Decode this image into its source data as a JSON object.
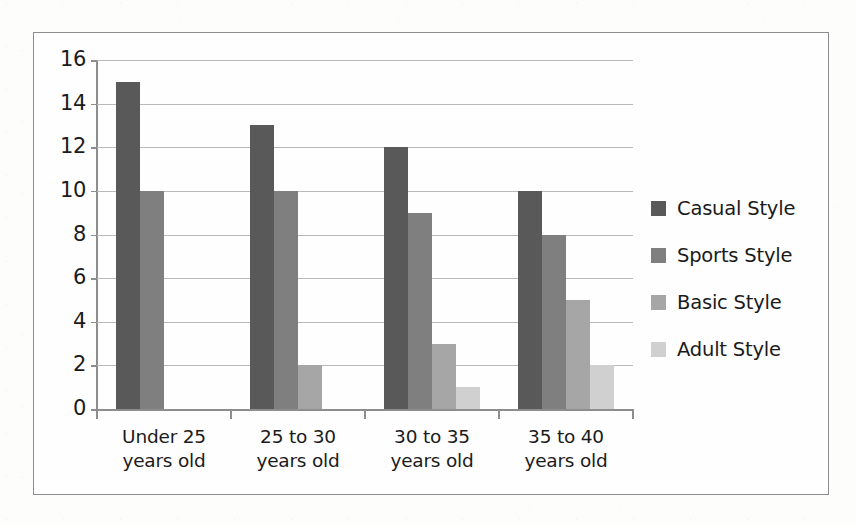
{
  "chart_data": {
    "type": "bar",
    "title": "",
    "xlabel": "",
    "ylabel": "",
    "ylim": [
      0,
      16
    ],
    "ytick_step": 2,
    "yticks": [
      16,
      14,
      12,
      10,
      8,
      6,
      4,
      2,
      0
    ],
    "grid": true,
    "legend_position": "right",
    "categories": [
      "Under 25 years old",
      "25 to 30 years old",
      "30 to 35 years old",
      "35 to 40 years old"
    ],
    "category_lines": [
      [
        "Under 25",
        "years old"
      ],
      [
        "25 to 30",
        "years old"
      ],
      [
        "30 to 35",
        "years old"
      ],
      [
        "35 to 40",
        "years old"
      ]
    ],
    "series": [
      {
        "name": "Casual Style",
        "color": "#595959",
        "values": [
          15,
          13,
          12,
          10
        ]
      },
      {
        "name": "Sports Style",
        "color": "#7f7f7f",
        "values": [
          10,
          10,
          9,
          8
        ]
      },
      {
        "name": "Basic Style",
        "color": "#a6a6a6",
        "values": [
          0,
          2,
          3,
          5
        ]
      },
      {
        "name": "Adult Style",
        "color": "#d0d0d0",
        "values": [
          0,
          0,
          1,
          2
        ]
      }
    ]
  },
  "legend": {
    "items": [
      {
        "label": "Casual Style",
        "color": "#595959"
      },
      {
        "label": "Sports Style",
        "color": "#7f7f7f"
      },
      {
        "label": "Basic Style",
        "color": "#a6a6a6"
      },
      {
        "label": "Adult Style",
        "color": "#d0d0d0"
      }
    ]
  },
  "axis": {
    "y_labels": [
      "16",
      "14",
      "12",
      "10",
      "8",
      "6",
      "4",
      "2",
      "0"
    ]
  },
  "style": {
    "grid_color": "#b9b9b9",
    "axis_color": "#8d8d8d",
    "frame_color": "#8d8d8d",
    "text_color": "#1b1b1b",
    "background": "#fefefe"
  }
}
